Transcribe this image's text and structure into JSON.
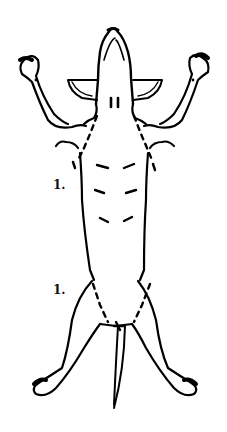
{
  "figure": {
    "stroke_color": "#000000",
    "background_color": "#ffffff",
    "labels": [
      {
        "text": "1.",
        "position": "left of thorax"
      },
      {
        "text": "1.",
        "position": "left of abdomen / hind limb"
      }
    ]
  }
}
